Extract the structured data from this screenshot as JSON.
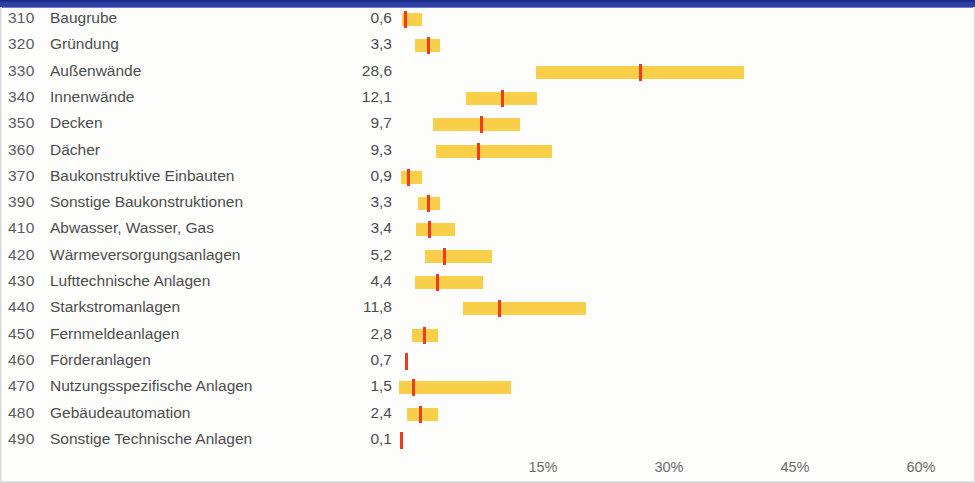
{
  "header": {
    "band_color": "#2e3fa3"
  },
  "colors": {
    "range": "#f9cf4a",
    "median": "#ef3b1e",
    "text": "#4d4d4d"
  },
  "chart_data": {
    "type": "bar",
    "title": "",
    "xlabel": "",
    "ylabel": "",
    "xlim": [
      0,
      64
    ],
    "grid": false,
    "legend": "none",
    "xticks": [
      "15%",
      "30%",
      "45%",
      "60%"
    ],
    "xtick_values": [
      15,
      30,
      45,
      60
    ],
    "categories": [
      "Baugrube",
      "Gründung",
      "Außenwände",
      "Innenwände",
      "Decken",
      "Dächer",
      "Baukonstruktive Einbauten",
      "Sonstige Baukonstruktionen",
      "Abwasser, Wasser, Gas",
      "Wärmeversorgungsanlagen",
      "Lufttechnische Anlagen",
      "Starkstromanlagen",
      "Fernmeldeanlagen",
      "Förderanlagen",
      "Nutzungsspezifische Anlagen",
      "Gebäudeautomation",
      "Sonstige Technische Anlagen"
    ],
    "codes": [
      "310",
      "320",
      "330",
      "340",
      "350",
      "360",
      "370",
      "390",
      "410",
      "420",
      "430",
      "440",
      "450",
      "460",
      "470",
      "480",
      "490"
    ],
    "values": [
      0.6,
      3.3,
      28.6,
      12.1,
      9.7,
      9.3,
      0.9,
      3.3,
      3.4,
      5.2,
      4.4,
      11.8,
      2.8,
      0.7,
      1.5,
      2.4,
      0.1
    ],
    "value_labels": [
      "0,6",
      "3,3",
      "28,6",
      "12,1",
      "9,7",
      "9,3",
      "0,9",
      "3,3",
      "3,4",
      "5,2",
      "4,4",
      "11,8",
      "2,8",
      "0,7",
      "1,5",
      "2,4",
      "0,1"
    ],
    "range_low": [
      0.4,
      1.9,
      16.3,
      8.0,
      4.0,
      4.4,
      0.2,
      2.3,
      2.0,
      3.1,
      1.9,
      7.6,
      1.5,
      0.0,
      0.0,
      1.0,
      0.0
    ],
    "range_high": [
      2.7,
      4.9,
      41.1,
      16.4,
      14.4,
      18.2,
      2.7,
      4.9,
      6.7,
      11.1,
      10.0,
      22.3,
      4.6,
      0.0,
      13.3,
      4.6,
      0.0
    ]
  },
  "rows": [
    {
      "code": "310",
      "label": "Baugrube",
      "value": "0,6",
      "median": 0.6,
      "low": 0.4,
      "high": 2.7
    },
    {
      "code": "320",
      "label": "Gründung",
      "value": "3,3",
      "median": 3.3,
      "low": 1.9,
      "high": 4.9
    },
    {
      "code": "330",
      "label": "Außenwände",
      "value": "28,6",
      "median": 28.6,
      "low": 16.3,
      "high": 41.1
    },
    {
      "code": "340",
      "label": "Innenwände",
      "value": "12,1",
      "median": 12.1,
      "low": 8.0,
      "high": 16.4
    },
    {
      "code": "350",
      "label": "Decken",
      "value": "9,7",
      "median": 9.7,
      "low": 4.0,
      "high": 14.4
    },
    {
      "code": "360",
      "label": "Dächer",
      "value": "9,3",
      "median": 9.3,
      "low": 4.4,
      "high": 18.2
    },
    {
      "code": "370",
      "label": "Baukonstruktive Einbauten",
      "value": "0,9",
      "median": 0.9,
      "low": 0.2,
      "high": 2.7
    },
    {
      "code": "390",
      "label": "Sonstige Baukonstruktionen",
      "value": "3,3",
      "median": 3.3,
      "low": 2.3,
      "high": 4.9
    },
    {
      "code": "410",
      "label": "Abwasser, Wasser, Gas",
      "value": "3,4",
      "median": 3.4,
      "low": 2.0,
      "high": 6.7
    },
    {
      "code": "420",
      "label": "Wärmeversorgungsanlagen",
      "value": "5,2",
      "median": 5.2,
      "low": 3.1,
      "high": 11.1
    },
    {
      "code": "430",
      "label": "Lufttechnische Anlagen",
      "value": "4,4",
      "median": 4.4,
      "low": 1.9,
      "high": 10.0
    },
    {
      "code": "440",
      "label": "Starkstromanlagen",
      "value": "11,8",
      "median": 11.8,
      "low": 7.6,
      "high": 22.3
    },
    {
      "code": "450",
      "label": "Fernmeldeanlagen",
      "value": "2,8",
      "median": 2.8,
      "low": 1.5,
      "high": 4.6
    },
    {
      "code": "460",
      "label": "Förderanlagen",
      "value": "0,7",
      "median": 0.7,
      "low": 0.0,
      "high": 0.0
    },
    {
      "code": "470",
      "label": "Nutzungsspezifische Anlagen",
      "value": "1,5",
      "median": 1.5,
      "low": 0.0,
      "high": 13.3
    },
    {
      "code": "480",
      "label": "Gebäudeautomation",
      "value": "2,4",
      "median": 2.4,
      "low": 1.0,
      "high": 4.6
    },
    {
      "code": "490",
      "label": "Sonstige Technische Anlagen",
      "value": "0,1",
      "median": 0.1,
      "low": 0.0,
      "high": 0.0
    }
  ],
  "axis": {
    "ticks": [
      {
        "label": "15%",
        "value": 15
      },
      {
        "label": "30%",
        "value": 30
      },
      {
        "label": "45%",
        "value": 45
      },
      {
        "label": "60%",
        "value": 60
      }
    ]
  }
}
